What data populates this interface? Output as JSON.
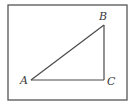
{
  "diagram": {
    "type": "right-triangle",
    "frame": {
      "x": 8,
      "y": 5,
      "width": 119,
      "height": 95,
      "stroke": "#555555"
    },
    "line_color": "#4a4a4a",
    "vertices": [
      {
        "id": "A",
        "label": "A",
        "x": 31,
        "y": 80,
        "label_x": 20,
        "label_y": 84
      },
      {
        "id": "B",
        "label": "B",
        "x": 104,
        "y": 25,
        "label_x": 99,
        "label_y": 20
      },
      {
        "id": "C",
        "label": "C",
        "x": 104,
        "y": 80,
        "label_x": 107,
        "label_y": 85
      }
    ],
    "edges": [
      [
        "A",
        "B"
      ],
      [
        "B",
        "C"
      ],
      [
        "C",
        "A"
      ]
    ],
    "right_angle_at": "C"
  }
}
